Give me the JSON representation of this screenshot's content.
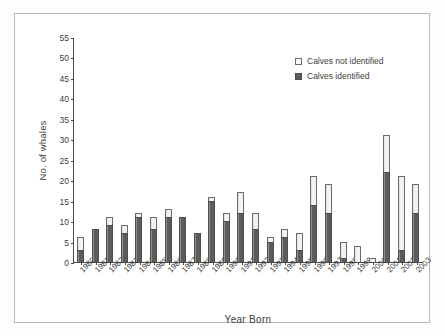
{
  "chart_data": {
    "type": "bar",
    "stacked": true,
    "title": "",
    "xlabel": "Year Born",
    "ylabel": "No. of whales",
    "ylim": [
      0,
      55
    ],
    "yticks": [
      0,
      5,
      10,
      15,
      20,
      25,
      30,
      35,
      40,
      45,
      50,
      55
    ],
    "grid": false,
    "legend_position": "top-right",
    "categories": [
      "1980",
      "1981",
      "1982",
      "1983",
      "1984",
      "1985",
      "1986",
      "1987",
      "1988",
      "1989",
      "1990",
      "1991",
      "1992",
      "1993",
      "1994",
      "1995",
      "1996",
      "1997",
      "1998",
      "1999",
      "2000",
      "2001",
      "2002",
      "2003"
    ],
    "series": [
      {
        "name": "Calves identified",
        "color": "#5c5c5c",
        "values": [
          3,
          8,
          9,
          7,
          11,
          8,
          11,
          11,
          7,
          15,
          10,
          12,
          8,
          5,
          6,
          3,
          14,
          12,
          1,
          0,
          0,
          22,
          3,
          12
        ]
      },
      {
        "name": "Calves not identified",
        "color": "#f2f2f2",
        "values": [
          3,
          0,
          2,
          2,
          1,
          3,
          2,
          0,
          0,
          1,
          2,
          5,
          4,
          1,
          2,
          4,
          7,
          7,
          4,
          4,
          1,
          9,
          18,
          7
        ]
      }
    ],
    "totals": [
      6,
      8,
      11,
      9,
      12,
      11,
      13,
      11,
      7,
      16,
      12,
      17,
      12,
      6,
      8,
      7,
      21,
      19,
      5,
      4,
      1,
      31,
      21,
      19
    ]
  },
  "legend": {
    "items": [
      {
        "label": "Calves not identified",
        "swatch": "light"
      },
      {
        "label": "Calves identified",
        "swatch": "dark"
      }
    ]
  }
}
